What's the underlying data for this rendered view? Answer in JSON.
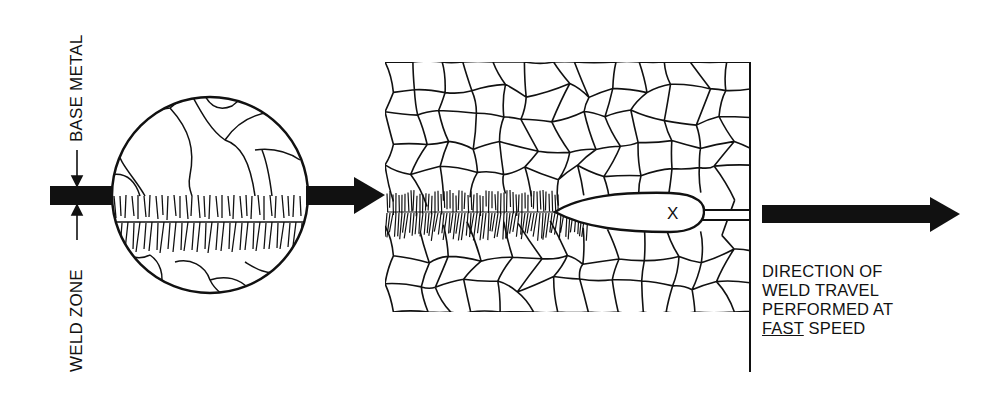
{
  "labels": {
    "base_metal": "BASE METAL",
    "weld_zone": "WELD ZONE",
    "caption_line1": "DIRECTION OF",
    "caption_line2": "WELD TRAVEL",
    "caption_line3": "PERFORMED AT",
    "caption_line4_emph": "FAST",
    "caption_line4_rest": " SPEED",
    "pool_marker": "X"
  },
  "colors": {
    "ink": "#111111",
    "background": "#ffffff"
  }
}
